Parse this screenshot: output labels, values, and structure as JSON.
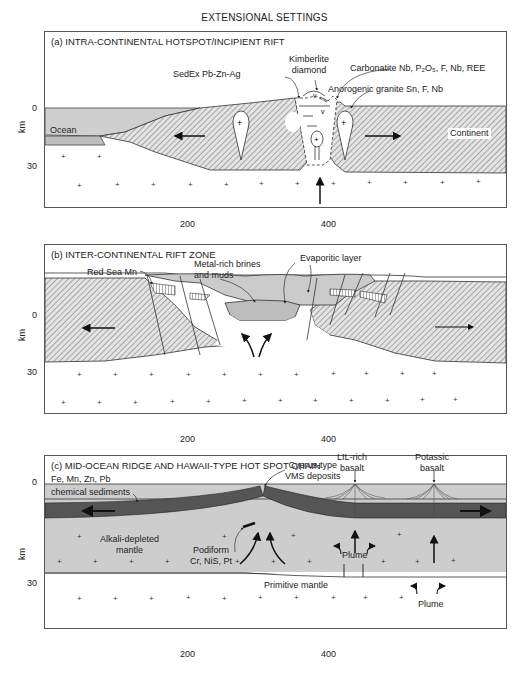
{
  "figure": {
    "title": "EXTENSIONAL SETTINGS",
    "axis_unit": "km",
    "depth_ticks": [
      "0",
      "30"
    ],
    "distance_ticks": [
      "200",
      "400"
    ]
  },
  "panels": [
    {
      "id": "a",
      "title": "(a) INTRA-CONTINENTAL HOTSPOT/INCIPIENT RIFT",
      "labels": {
        "kimberlite": "Kimberlite",
        "kimberlite2": "diamond",
        "sedex": "SedEx Pb-Zn-Ag",
        "carbonatite": "Carbonatite Nb, P₂O₅, F, Nb, REE",
        "granite": "Anorogenic granite Sn, F, Nb",
        "ocean": "Ocean",
        "continent": "Continent"
      }
    },
    {
      "id": "b",
      "title": "(b) INTER-CONTINENTAL RIFT ZONE",
      "labels": {
        "redsea": "Red Sea Mn",
        "brines1": "Metal-rich brines",
        "brines2": "and muds",
        "evaporitic": "Evaporitic layer"
      }
    },
    {
      "id": "c",
      "title": "(c) MID-OCEAN RIDGE AND HAWAII-TYPE HOT SPOT CHAIN",
      "labels": {
        "lil1": "LIL-rich",
        "lil2": "basalt",
        "potassic1": "Potassic",
        "potassic2": "basalt",
        "cyprus1": "Cyprus-type",
        "cyprus2": "VMS deposits",
        "femn": "Fe, Mn, Zn, Pb",
        "chem": "chemical sediments",
        "alkali1": "Alkali-depleted",
        "alkali2": "mantle",
        "podiform1": "Podiform",
        "podiform2": "Cr, NiS, Pt",
        "plume1": "Plume",
        "plume2": "Plume",
        "primitive": "Primitive mantle"
      }
    }
  ],
  "colors": {
    "crust_gray": "#c9c9c9",
    "hatch": "#555555",
    "oceanic_plate": "#5a5a5a",
    "fill_light": "#d4d4d4"
  }
}
